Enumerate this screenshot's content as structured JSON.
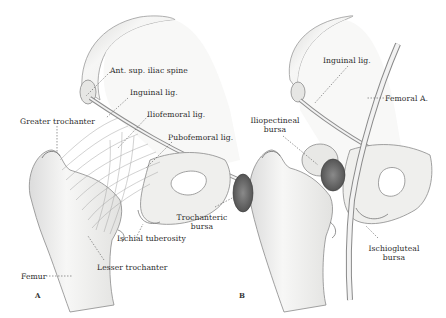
{
  "figure": {
    "panels": [
      {
        "id": "A",
        "letter": "A",
        "labels": {
          "ant_sup_iliac_spine": "Ant. sup. iliac spine",
          "inguinal_lig": "Inguinal lig.",
          "iliofemoral_lig": "Iliofemoral lig.",
          "greater_trochanter": "Greater trochanter",
          "pubofemoral_lig": "Pubofemoral lig.",
          "ischial_tuberosity": "Ischial tuberosity",
          "lesser_trochanter": "Lesser trochanter",
          "femur": "Femur"
        }
      },
      {
        "id": "B",
        "letter": "B",
        "labels": {
          "inguinal_lig": "Inguinal lig.",
          "femoral_a": "Femoral A.",
          "iliopectineal_bursa_line1": "Iliopectineal",
          "iliopectineal_bursa_line2": "bursa",
          "trochanteric_bursa_line1": "Trochanteric",
          "trochanteric_bursa_line2": "bursa",
          "ischiogluteal_bursa_line1": "Ischiogluteal",
          "ischiogluteal_bursa_line2": "bursa"
        }
      }
    ],
    "colors": {
      "bone_fill": "#f4f4f2",
      "bone_stroke": "#8a8a8a",
      "shade": "#cfcfcf",
      "bursa": "#6a6a6a",
      "label_text": "#2a2a2a",
      "leader_line": "#555555"
    }
  }
}
